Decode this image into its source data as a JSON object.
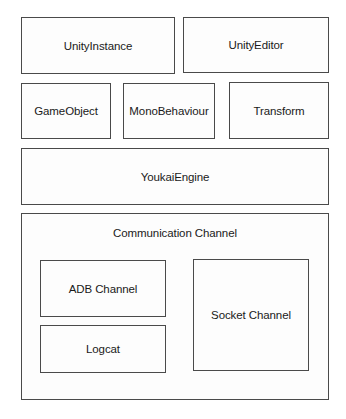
{
  "diagram": {
    "type": "architecture-block-diagram",
    "rows": [
      [
        "UnityInstance",
        "UnityEditor"
      ],
      [
        "GameObject",
        "MonoBehaviour",
        "Transform"
      ],
      [
        "YoukaiEngine"
      ]
    ],
    "blocks": {
      "unity_instance": "UnityInstance",
      "unity_editor": "UnityEditor",
      "game_object": "GameObject",
      "mono_behaviour": "MonoBehaviour",
      "transform": "Transform",
      "youkai_engine": "YoukaiEngine"
    },
    "communication": {
      "title": "Communication Channel",
      "children": {
        "adb": "ADB Channel",
        "logcat": "Logcat",
        "socket": "Socket Channel"
      }
    },
    "colors": {
      "border": "#4a4a4a",
      "background": "#ffffff",
      "text": "#1a1a1a"
    }
  }
}
